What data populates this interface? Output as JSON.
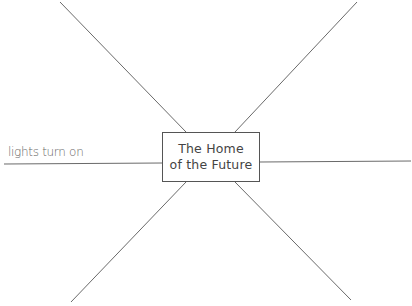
{
  "diagram": {
    "center_label_line1": "The Home",
    "center_label_line2": "of the Future",
    "spokes": [
      {
        "position": "top-left",
        "text": ""
      },
      {
        "position": "top-right",
        "text": ""
      },
      {
        "position": "left",
        "text": "lights turn on"
      },
      {
        "position": "right",
        "text": ""
      },
      {
        "position": "bottom-left",
        "text": ""
      },
      {
        "position": "bottom-right",
        "text": ""
      }
    ],
    "line_color": "#6a6a6a"
  }
}
